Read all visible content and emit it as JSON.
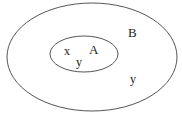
{
  "diagram": {
    "type": "venn-subset",
    "sets": [
      {
        "id": "B",
        "label": "B",
        "role": "outer"
      },
      {
        "id": "A",
        "label": "A",
        "role": "inner"
      }
    ],
    "elements": [
      {
        "label": "x",
        "region": "A"
      },
      {
        "label": "y",
        "region": "A-boundary"
      },
      {
        "label": "y",
        "region": "B-only"
      }
    ],
    "stroke_color": "#555555"
  }
}
